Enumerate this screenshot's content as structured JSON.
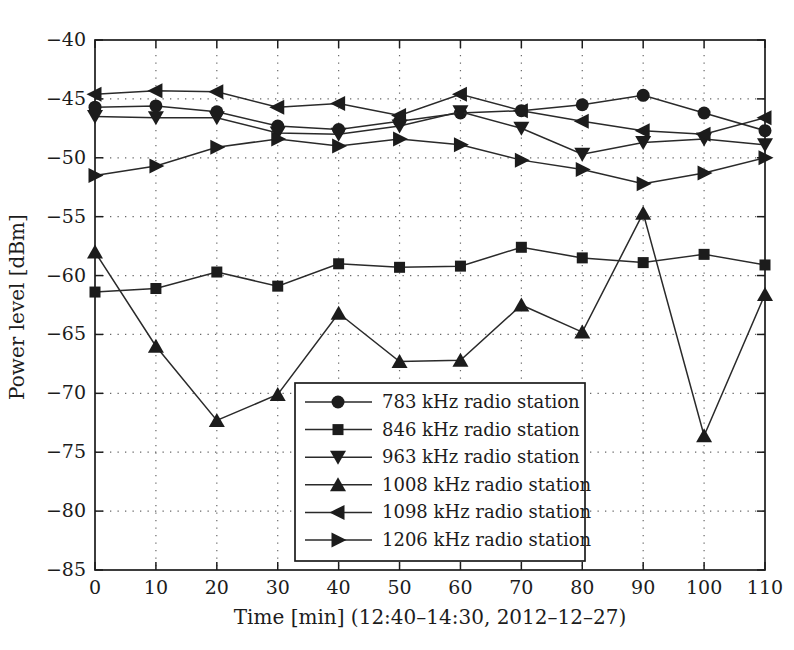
{
  "figure": {
    "background": "#ffffff",
    "ink_color": "#1c1c1c",
    "grid_color": "#666666"
  },
  "chart_data": {
    "type": "line",
    "title": "",
    "xlabel": "Time [min] (12:40–14:30, 2012–12–27)",
    "ylabel": "Power level [dBm]",
    "xlim": [
      0,
      110
    ],
    "ylim": [
      -85,
      -40
    ],
    "xticks": [
      0,
      10,
      20,
      30,
      40,
      50,
      60,
      70,
      80,
      90,
      100,
      110
    ],
    "yticks": [
      -40,
      -45,
      -50,
      -55,
      -60,
      -65,
      -70,
      -75,
      -80,
      -85
    ],
    "grid": "dotted",
    "legend_position": "inside lower center-right",
    "x": [
      0,
      10,
      20,
      30,
      40,
      50,
      60,
      70,
      80,
      90,
      100,
      110
    ],
    "series": [
      {
        "name": "783 kHz radio station",
        "marker": "circle",
        "values": [
          -45.7,
          -45.6,
          -46.1,
          -47.3,
          -47.6,
          -46.9,
          -46.2,
          -46.0,
          -45.5,
          -44.7,
          -46.2,
          -47.7
        ]
      },
      {
        "name": "846 kHz radio station",
        "marker": "square",
        "values": [
          -61.4,
          -61.1,
          -59.7,
          -60.9,
          -59.0,
          -59.3,
          -59.2,
          -57.6,
          -58.5,
          -58.9,
          -58.2,
          -59.1
        ]
      },
      {
        "name": "963 kHz radio station",
        "marker": "triangle-down",
        "values": [
          -46.5,
          -46.6,
          -46.6,
          -47.9,
          -48.0,
          -47.3,
          -46.1,
          -47.5,
          -49.7,
          -48.7,
          -48.4,
          -48.9
        ]
      },
      {
        "name": "1008 kHz radio station",
        "marker": "triangle-up",
        "values": [
          -58.0,
          -66.0,
          -72.3,
          -70.1,
          -63.2,
          -67.3,
          -67.2,
          -62.5,
          -64.8,
          -54.7,
          -73.6,
          -61.6
        ]
      },
      {
        "name": "1098 kHz radio station",
        "marker": "triangle-left",
        "values": [
          -44.6,
          -44.3,
          -44.4,
          -45.7,
          -45.4,
          -46.4,
          -44.6,
          -46.0,
          -46.9,
          -47.7,
          -48.0,
          -46.6
        ]
      },
      {
        "name": "1206 kHz radio station",
        "marker": "triangle-right",
        "values": [
          -51.5,
          -50.7,
          -49.1,
          -48.4,
          -49.0,
          -48.4,
          -48.9,
          -50.2,
          -51.0,
          -52.2,
          -51.3,
          -50.0
        ]
      }
    ]
  }
}
